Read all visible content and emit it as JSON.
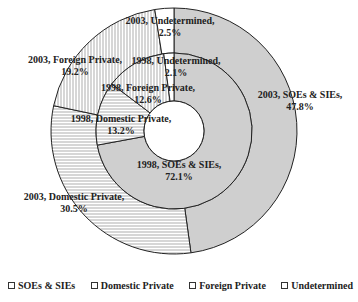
{
  "chart_data": {
    "type": "pie",
    "subtype": "nested-donut",
    "start_angle_deg": 0,
    "direction": "clockwise",
    "categories": [
      "SOEs & SIEs",
      "Domestic Private",
      "Foreign Private",
      "Undetermined"
    ],
    "series": [
      {
        "name": "1998",
        "ring": "inner",
        "values": [
          72.1,
          13.2,
          12.6,
          2.1
        ]
      },
      {
        "name": "2003",
        "ring": "outer",
        "values": [
          47.8,
          30.5,
          19.2,
          2.5
        ]
      }
    ],
    "labels": [
      {
        "ring": "outer",
        "line1": "2003, SOEs & SIEs,",
        "line2": "47.8%",
        "x": 300,
        "y": 98
      },
      {
        "ring": "outer",
        "line1": "2003, Domestic Private,",
        "line2": "30.5%",
        "x": 74,
        "y": 200
      },
      {
        "ring": "outer",
        "line1": "2003, Foreign Private,",
        "line2": "19.2%",
        "x": 75,
        "y": 63
      },
      {
        "ring": "outer",
        "line1": "2003, Undetermined,",
        "line2": "2.5%",
        "x": 170,
        "y": 24
      },
      {
        "ring": "inner",
        "line1": "1998, SOEs & SIEs,",
        "line2": "72.1%",
        "x": 179,
        "y": 168
      },
      {
        "ring": "inner",
        "line1": "1998, Domestic Private,",
        "line2": "13.2%",
        "x": 121,
        "y": 122
      },
      {
        "ring": "inner",
        "line1": "1998, Foreign Private,",
        "line2": "12.6%",
        "x": 148,
        "y": 91
      },
      {
        "ring": "inner",
        "line1": "1998, Undetermined,",
        "line2": "2.1%",
        "x": 176,
        "y": 64
      }
    ],
    "title": "",
    "legend_position": "bottom"
  },
  "legend": {
    "items": [
      {
        "label": "SOEs & SIEs"
      },
      {
        "label": "Domestic Private"
      },
      {
        "label": "Foreign Private"
      },
      {
        "label": "Undetermined"
      }
    ]
  },
  "style": {
    "fills": [
      "gray",
      "horizontal-stripes",
      "vertical-stripes",
      "white"
    ],
    "gray": "#cfcfcf",
    "stroke": "#222222"
  }
}
